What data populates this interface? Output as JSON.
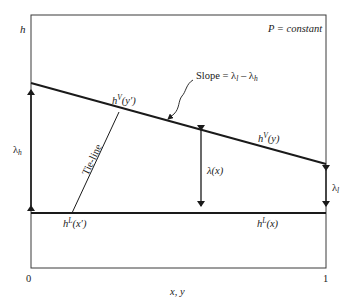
{
  "figure": {
    "condition_label": "P = constant",
    "y_axis_label": "h",
    "x_axis_label": "x, y",
    "x_tick_min": "0",
    "x_tick_max": "1",
    "slope_label": "Slope = λ",
    "slope_sub_l": "l",
    "slope_minus": " – λ",
    "slope_sub_h": "h",
    "vapor_point_label": "h",
    "vapor_point_sup": "V",
    "vapor_point_arg": "(y′)",
    "vapor_line_label": "h",
    "vapor_line_sup": "V",
    "vapor_line_arg": "(y)",
    "liquid_point_label": "h",
    "liquid_point_sup": "L",
    "liquid_point_arg": "(x′)",
    "liquid_line_label": "h",
    "liquid_line_sup": "L",
    "liquid_line_arg": "(x)",
    "tie_line_label": "Tie-line",
    "lambda_h_label": "λ",
    "lambda_h_sub": "h",
    "lambda_x_label": "λ(x)",
    "lambda_l_label": "λ",
    "lambda_l_sub": "l",
    "colors": {
      "line": "#1a1a1a",
      "background": "#ffffff"
    }
  }
}
